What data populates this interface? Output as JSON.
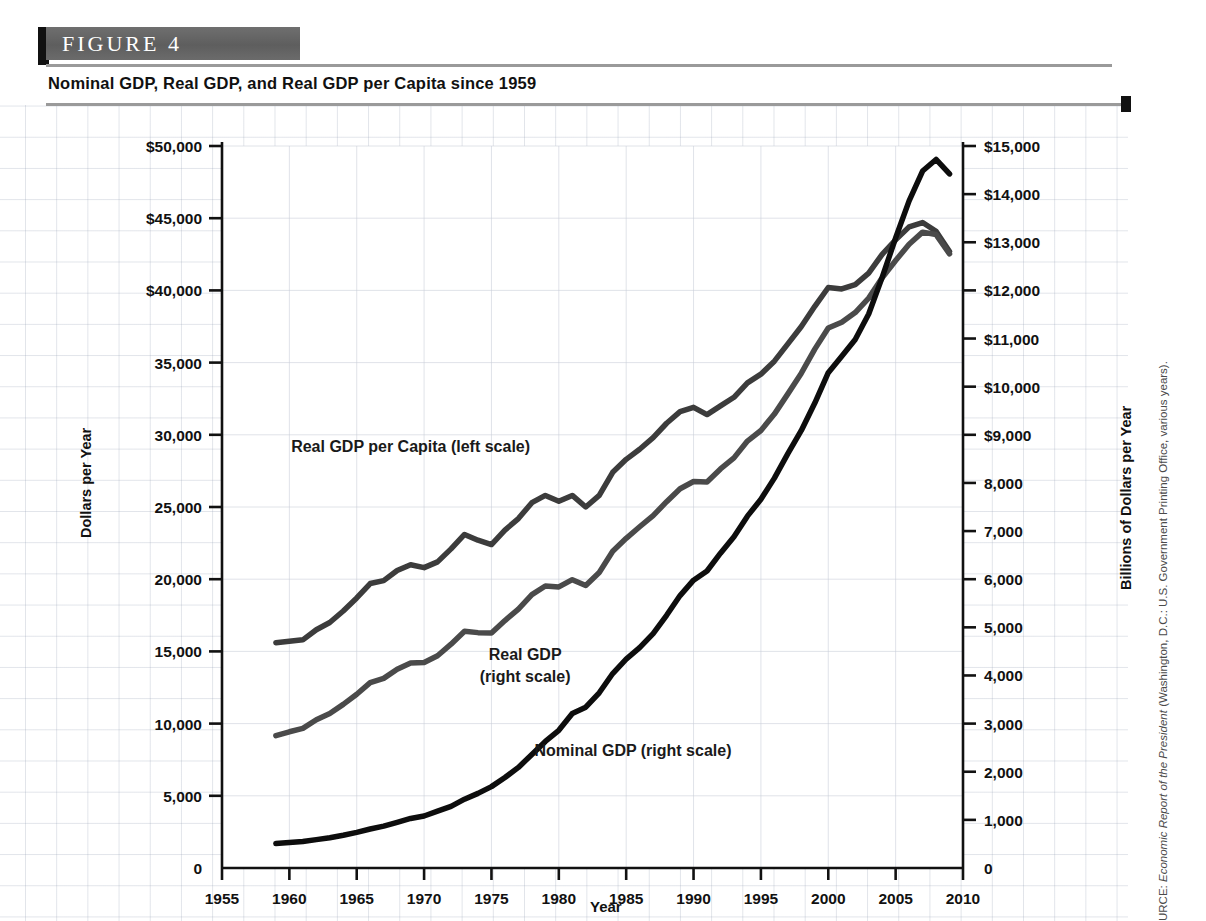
{
  "figure": {
    "label": "FIGURE  4",
    "subtitle": "Nominal GDP, Real GDP, and Real GDP per Capita since 1959",
    "source_prefix": "URCE: ",
    "source_italic": "Economic Report of the President",
    "source_rest": " (Washington, D.C.: U.S. Government Printing Office, various years)."
  },
  "colors": {
    "band": "#5e5e5e",
    "tab": "#111111",
    "rule": "#9a9a9a",
    "nominal_gdp": "#0d0d0d",
    "real_gdp": "#4a4a4a",
    "real_gdp_per_capita": "#3c3c3c",
    "grid": "#c8cdd8",
    "axis": "#111111"
  },
  "chart_data": {
    "type": "line",
    "title": "Nominal GDP, Real GDP, and Real GDP per Capita since 1959",
    "xlabel": "Year",
    "ylabel_left": "Dollars per Year",
    "ylabel_right": "Billions of Dollars per Year",
    "grid": true,
    "legend_position": "inline-annotations",
    "xlim": [
      1955,
      2010
    ],
    "xticks": [
      "1955",
      "1960",
      "1965",
      "1970",
      "1975",
      "1980",
      "1985",
      "1990",
      "1995",
      "2000",
      "2005",
      "2010"
    ],
    "xtick_values": [
      1955,
      1960,
      1965,
      1970,
      1975,
      1980,
      1985,
      1990,
      1995,
      2000,
      2005,
      2010
    ],
    "ylim_left": [
      0,
      50000
    ],
    "yticks_left": [
      "0",
      "5,000",
      "10,000",
      "15,000",
      "20,000",
      "25,000",
      "30,000",
      "35,000",
      "$40,000",
      "$45,000",
      "$50,000"
    ],
    "ytick_values_left": [
      0,
      5000,
      10000,
      15000,
      20000,
      25000,
      30000,
      35000,
      40000,
      45000,
      50000
    ],
    "ylim_right": [
      0,
      15000
    ],
    "yticks_right": [
      "0",
      "1,000",
      "2,000",
      "3,000",
      "4,000",
      "5,000",
      "6,000",
      "7,000",
      "8,000",
      "$9,000",
      "$10,000",
      "$11,000",
      "$12,000",
      "$13,000",
      "$14,000",
      "$15,000"
    ],
    "ytick_values_right": [
      0,
      1000,
      2000,
      3000,
      4000,
      5000,
      6000,
      7000,
      8000,
      9000,
      10000,
      11000,
      12000,
      13000,
      14000,
      15000
    ],
    "annotations": [
      {
        "text": "Real GDP per Capita (left scale)",
        "x": 1969.0,
        "y_px": 452
      },
      {
        "text": "Real GDP",
        "x": 1977.5,
        "y_px": 660
      },
      {
        "text": "(right scale)",
        "x": 1977.5,
        "y_px": 682
      },
      {
        "text": "Nominal GDP (right scale)",
        "x": 1985.5,
        "y_px": 756
      }
    ],
    "x": [
      1959,
      1960,
      1961,
      1962,
      1963,
      1964,
      1965,
      1966,
      1967,
      1968,
      1969,
      1970,
      1971,
      1972,
      1973,
      1974,
      1975,
      1976,
      1977,
      1978,
      1979,
      1980,
      1981,
      1982,
      1983,
      1984,
      1985,
      1986,
      1987,
      1988,
      1989,
      1990,
      1991,
      1992,
      1993,
      1994,
      1995,
      1996,
      1997,
      1998,
      1999,
      2000,
      2001,
      2002,
      2003,
      2004,
      2005,
      2006,
      2007,
      2008,
      2009
    ],
    "series": [
      {
        "name": "Real GDP per Capita (left scale)",
        "axis": "left",
        "units": "Dollars per Year",
        "values": [
          15600,
          15700,
          15800,
          16500,
          17000,
          17800,
          18700,
          19700,
          19900,
          20600,
          21000,
          20800,
          21200,
          22100,
          23100,
          22700,
          22400,
          23400,
          24200,
          25300,
          25800,
          25400,
          25800,
          25000,
          25800,
          27400,
          28300,
          29000,
          29800,
          30800,
          31600,
          31900,
          31400,
          32000,
          32600,
          33600,
          34200,
          35100,
          36300,
          37500,
          38900,
          40200,
          40100,
          40400,
          41200,
          42500,
          43500,
          44400,
          44700,
          44100,
          42700
        ]
      },
      {
        "name": "Real GDP (right scale)",
        "axis": "right",
        "units": "Billions of Dollars per Year",
        "values": [
          2750,
          2830,
          2900,
          3080,
          3210,
          3400,
          3610,
          3850,
          3940,
          4130,
          4260,
          4270,
          4410,
          4650,
          4920,
          4890,
          4880,
          5140,
          5380,
          5680,
          5860,
          5840,
          5990,
          5870,
          6140,
          6580,
          6850,
          7090,
          7320,
          7610,
          7880,
          8030,
          8020,
          8290,
          8520,
          8870,
          9090,
          9430,
          9850,
          10280,
          10780,
          11220,
          11340,
          11540,
          11840,
          12260,
          12620,
          12960,
          13210,
          13160,
          12760
        ]
      },
      {
        "name": "Nominal GDP (right scale)",
        "axis": "right",
        "units": "Billions of Dollars per Year",
        "values": [
          510,
          530,
          550,
          590,
          630,
          680,
          740,
          810,
          870,
          950,
          1030,
          1080,
          1180,
          1280,
          1430,
          1550,
          1690,
          1880,
          2090,
          2360,
          2630,
          2860,
          3210,
          3340,
          3640,
          4040,
          4340,
          4580,
          4870,
          5250,
          5660,
          5980,
          6170,
          6540,
          6880,
          7310,
          7660,
          8100,
          8610,
          9090,
          9660,
          10290,
          10630,
          10980,
          11510,
          12270,
          13090,
          13860,
          14480,
          14720,
          14420
        ]
      }
    ]
  }
}
